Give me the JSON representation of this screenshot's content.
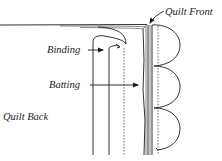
{
  "diagram": {
    "labels": {
      "quilt_front": "Quilt Front",
      "binding": "Binding",
      "batting": "Batting",
      "quilt_back": "Quilt Back"
    },
    "colors": {
      "line": "#1a1a1a",
      "text": "#222222",
      "background": "#ffffff"
    }
  }
}
